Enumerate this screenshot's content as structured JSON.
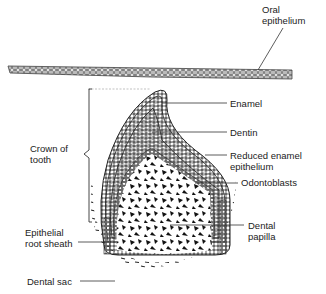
{
  "figure": {
    "labels": {
      "oral_epithelium": "Oral\nepithelium",
      "enamel": "Enamel",
      "dentin": "Dentin",
      "reduced_enamel_epithelium": "Reduced enamel\nepithelium",
      "odontoblasts": "Odontoblasts",
      "crown_of_tooth": "Crown of\ntooth",
      "dental_papilla": "Dental\npapilla",
      "epithelial_root_sheath": "Epithelial\nroot sheath",
      "dental_sac": "Dental sac"
    },
    "colors": {
      "line": "#333333",
      "background": "#ffffff",
      "cells": "#999999"
    }
  }
}
